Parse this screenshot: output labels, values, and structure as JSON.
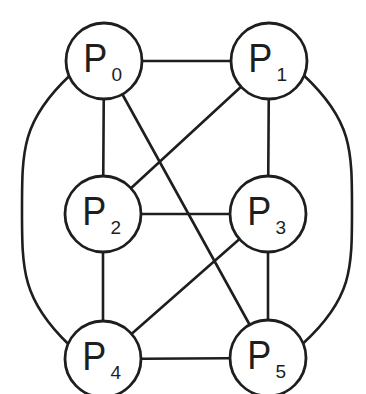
{
  "diagram": {
    "type": "graph",
    "stroke_color": "#1e1e1e",
    "background_color": "#ffffff",
    "nodes": [
      {
        "id": "P0",
        "letter": "P",
        "sub": "0",
        "cx": 104,
        "cy": 61,
        "r": 38
      },
      {
        "id": "P1",
        "letter": "P",
        "sub": "1",
        "cx": 269,
        "cy": 61,
        "r": 38
      },
      {
        "id": "P2",
        "letter": "P",
        "sub": "2",
        "cx": 103,
        "cy": 214,
        "r": 38
      },
      {
        "id": "P3",
        "letter": "P",
        "sub": "3",
        "cx": 268,
        "cy": 214,
        "r": 38
      },
      {
        "id": "P4",
        "letter": "P",
        "sub": "4",
        "cx": 103,
        "cy": 359,
        "r": 38
      },
      {
        "id": "P5",
        "letter": "P",
        "sub": "5",
        "cx": 268,
        "cy": 358,
        "r": 38
      }
    ],
    "edges": [
      {
        "from": "P0",
        "to": "P1",
        "shape": "straight"
      },
      {
        "from": "P0",
        "to": "P2",
        "shape": "straight"
      },
      {
        "from": "P0",
        "to": "P5",
        "shape": "straight"
      },
      {
        "from": "P0",
        "to": "P4",
        "shape": "arc-left"
      },
      {
        "from": "P1",
        "to": "P2",
        "shape": "straight"
      },
      {
        "from": "P1",
        "to": "P3",
        "shape": "straight"
      },
      {
        "from": "P1",
        "to": "P5",
        "shape": "arc-right"
      },
      {
        "from": "P2",
        "to": "P3",
        "shape": "straight"
      },
      {
        "from": "P2",
        "to": "P4",
        "shape": "straight"
      },
      {
        "from": "P3",
        "to": "P4",
        "shape": "straight"
      },
      {
        "from": "P3",
        "to": "P5",
        "shape": "straight"
      },
      {
        "from": "P4",
        "to": "P5",
        "shape": "straight"
      }
    ]
  }
}
